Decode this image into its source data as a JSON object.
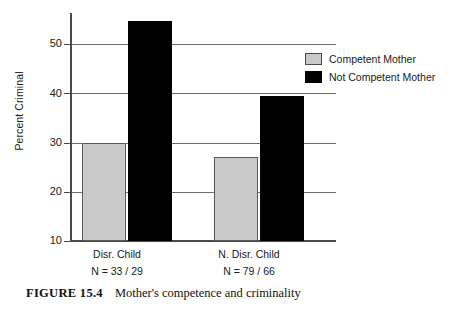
{
  "figure": {
    "caption_label": "FIGURE 15.4",
    "caption_text": "Mother's competence and criminality"
  },
  "chart_data": {
    "type": "bar",
    "title": "",
    "xlabel": "",
    "ylabel": "Percent Criminal",
    "ylim": [
      10,
      56
    ],
    "yticks": [
      10,
      20,
      30,
      40,
      50
    ],
    "ytick_labels": [
      "10",
      "20",
      "30",
      "40",
      "50"
    ],
    "grid": true,
    "grid_axis": "y",
    "legend_position": "right",
    "categories": [
      "Disr. Child",
      "N. Disr. Child"
    ],
    "category_sublabels": [
      "N = 33 / 29",
      "N = 79 / 66"
    ],
    "series": [
      {
        "name": "Competent Mother",
        "color": "#c9c9c9",
        "edge_color": "#5a5a5a",
        "values": [
          30,
          27
        ]
      },
      {
        "name": "Not Competent Mother",
        "color": "#000000",
        "edge_color": "#000000",
        "values": [
          54.7,
          39.5
        ]
      }
    ]
  },
  "axis": {
    "y_label": "Percent Criminal",
    "tick_10": "10",
    "tick_20": "20",
    "tick_30": "30",
    "tick_40": "40",
    "tick_50": "50"
  },
  "groups": [
    {
      "name": "Disr. Child",
      "n": "N = 33 / 29"
    },
    {
      "name": "N. Disr. Child",
      "n": "N = 79 / 66"
    }
  ],
  "legend": {
    "items": [
      {
        "label": "Competent Mother",
        "color": "#c9c9c9"
      },
      {
        "label": "Not Competent Mother",
        "color": "#000000"
      }
    ]
  }
}
